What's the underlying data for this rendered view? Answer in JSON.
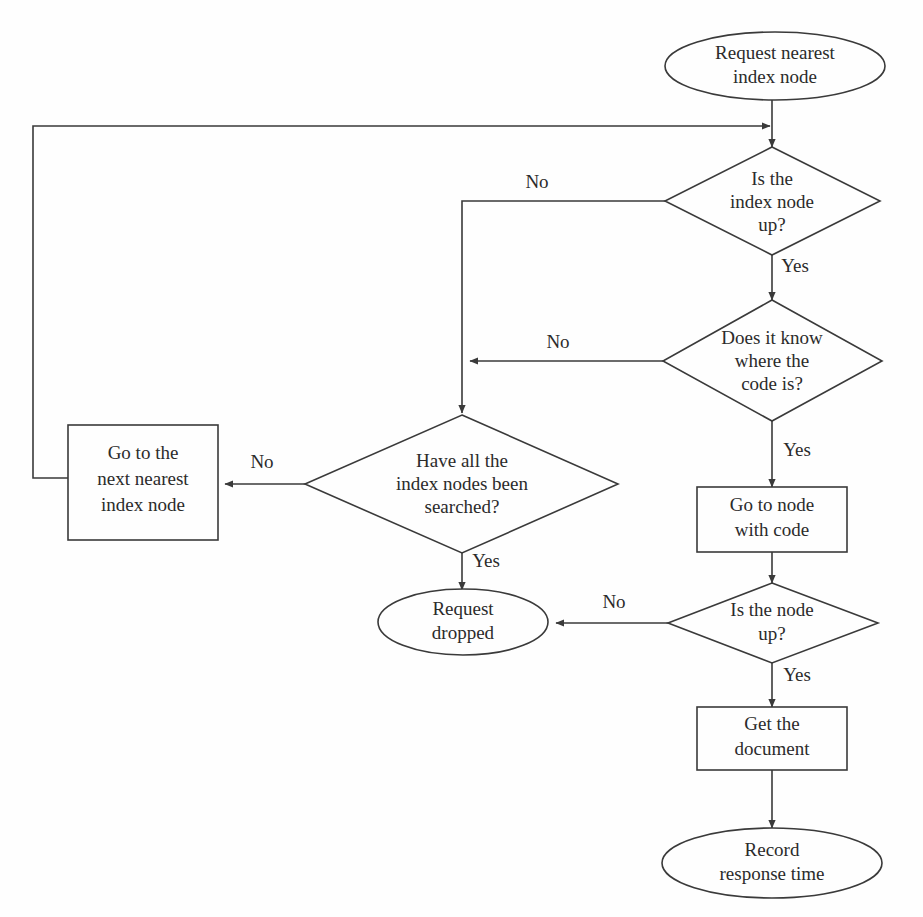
{
  "diagram": {
    "background_color": "#fefefe",
    "line_color": "#3a3a3a",
    "text_color": "#2b2b2b",
    "nodes": {
      "start": {
        "shape": "ellipse",
        "line1": "Request nearest",
        "line2": "index node"
      },
      "decision_index_node_up": {
        "shape": "diamond",
        "line1": "Is the",
        "line2": "index node",
        "line3": "up?"
      },
      "decision_knows_code": {
        "shape": "diamond",
        "line1": "Does it know",
        "line2": "where the",
        "line3": "code is?"
      },
      "decision_all_searched": {
        "shape": "diamond",
        "line1": "Have all the",
        "line2": "index nodes been",
        "line3": "searched?"
      },
      "process_next_nearest": {
        "shape": "rectangle",
        "line1": "Go to the",
        "line2": "next nearest",
        "line3": "index node"
      },
      "process_go_to_node": {
        "shape": "rectangle",
        "line1": "Go to node",
        "line2": "with code"
      },
      "decision_node_up": {
        "shape": "diamond",
        "line1": "Is the node",
        "line2": "up?"
      },
      "terminal_request_dropped": {
        "shape": "ellipse",
        "line1": "Request",
        "line2": "dropped"
      },
      "process_get_document": {
        "shape": "rectangle",
        "line1": "Get the",
        "line2": "document"
      },
      "terminal_record_response": {
        "shape": "ellipse",
        "line1": "Record",
        "line2": "response time"
      }
    },
    "edge_labels": {
      "index_node_up_no": "No",
      "index_node_up_yes": "Yes",
      "knows_code_no": "No",
      "knows_code_yes": "Yes",
      "all_searched_no": "No",
      "all_searched_yes": "Yes",
      "node_up_no": "No",
      "node_up_yes": "Yes"
    }
  }
}
